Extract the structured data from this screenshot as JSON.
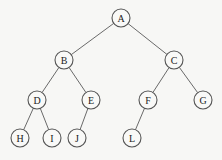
{
  "diagram": {
    "type": "binary-tree",
    "node_radius": 9,
    "nodes": [
      {
        "id": "A",
        "label": "A",
        "x": 121,
        "y": 18
      },
      {
        "id": "B",
        "label": "B",
        "x": 64,
        "y": 60
      },
      {
        "id": "C",
        "label": "C",
        "x": 174,
        "y": 60
      },
      {
        "id": "D",
        "label": "D",
        "x": 37,
        "y": 100
      },
      {
        "id": "E",
        "label": "E",
        "x": 91,
        "y": 100
      },
      {
        "id": "F",
        "label": "F",
        "x": 148,
        "y": 100
      },
      {
        "id": "G",
        "label": "G",
        "x": 203,
        "y": 100
      },
      {
        "id": "H",
        "label": "H",
        "x": 20,
        "y": 138
      },
      {
        "id": "I",
        "label": "I",
        "x": 52,
        "y": 138
      },
      {
        "id": "J",
        "label": "J",
        "x": 77,
        "y": 138
      },
      {
        "id": "L",
        "label": "L",
        "x": 132,
        "y": 138
      }
    ],
    "edges": [
      [
        "A",
        "B"
      ],
      [
        "A",
        "C"
      ],
      [
        "B",
        "D"
      ],
      [
        "B",
        "E"
      ],
      [
        "C",
        "F"
      ],
      [
        "C",
        "G"
      ],
      [
        "D",
        "H"
      ],
      [
        "D",
        "I"
      ],
      [
        "E",
        "J"
      ],
      [
        "F",
        "L"
      ]
    ]
  }
}
